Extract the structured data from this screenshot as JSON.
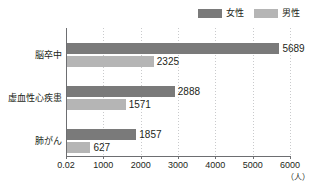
{
  "chart_data": {
    "type": "bar",
    "orientation": "horizontal",
    "title": "",
    "xlabel": "（人）",
    "ylabel": "",
    "xlim": [
      0,
      6000
    ],
    "grid": true,
    "legend_position": "top-right",
    "categories": [
      "脳卒中",
      "虚血性心疾患",
      "肺がん"
    ],
    "tick_labels": [
      "0.02",
      "1000",
      "2000",
      "3000",
      "4000",
      "5000",
      "6000"
    ],
    "tick_values": [
      0,
      1000,
      2000,
      3000,
      4000,
      5000,
      6000
    ],
    "series": [
      {
        "name": "女性",
        "color": "#7a7a7a",
        "values": [
          5689,
          2325,
          1857
        ],
        "value_labels": [
          "5689",
          "2325",
          "1857"
        ]
      },
      {
        "name": "男性",
        "color": "#b5b5b5",
        "values": [
          2325,
          1571,
          627
        ],
        "value_labels": [
          "2325",
          "1571",
          "627"
        ]
      }
    ],
    "groups": [
      {
        "category": "脳卒中",
        "female": 5689,
        "male": 2325,
        "female_label": "5689",
        "male_label": "2325"
      },
      {
        "category": "虚血性心疾患",
        "female": 2888,
        "male": 1571,
        "female_label": "2888",
        "male_label": "1571"
      },
      {
        "category": "肺がん",
        "female": 1857,
        "male": 627,
        "female_label": "1857",
        "male_label": "627"
      }
    ]
  },
  "legend": {
    "items": [
      {
        "label": "女性",
        "color": "#7a7a7a"
      },
      {
        "label": "男性",
        "color": "#b5b5b5"
      }
    ]
  },
  "axis": {
    "unit": "（人）",
    "ticks": [
      "0.02",
      "1000",
      "2000",
      "3000",
      "4000",
      "5000",
      "6000"
    ]
  }
}
